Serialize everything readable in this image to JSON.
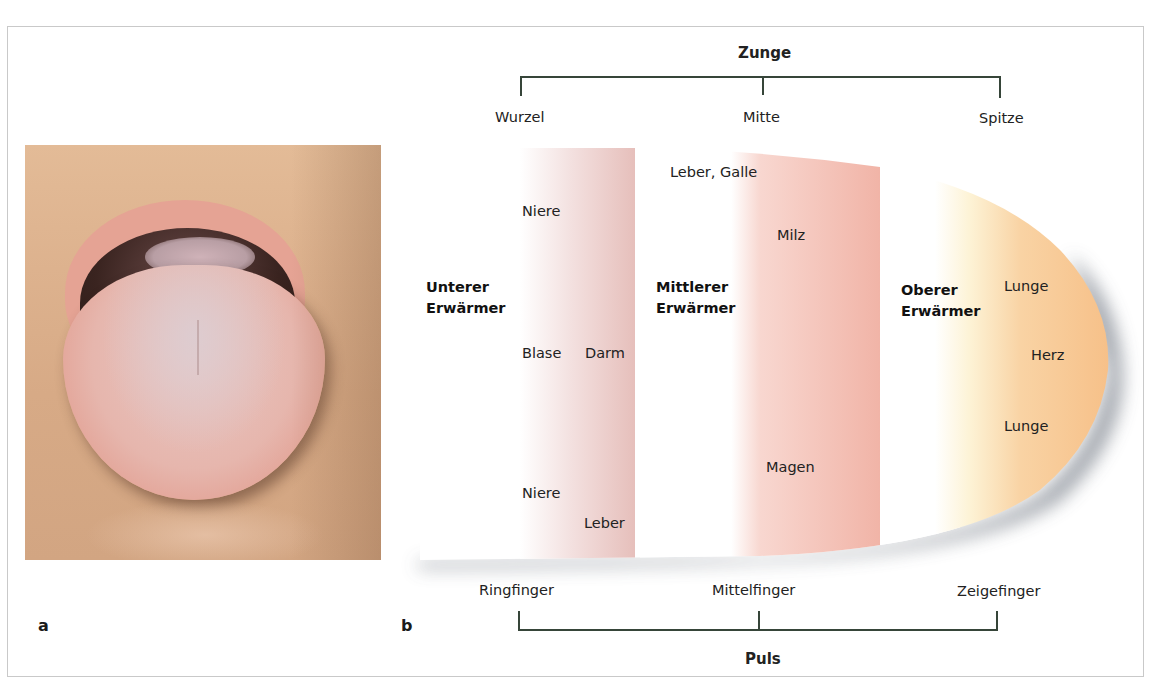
{
  "figure": {
    "panel_a_label": "a",
    "panel_b_label": "b",
    "photo_description": "tongue-photo"
  },
  "tongue": {
    "title": "Zunge",
    "parts": [
      "Wurzel",
      "Mitte",
      "Spitze"
    ]
  },
  "pulse": {
    "title": "Puls",
    "fingers": [
      "Ringfinger",
      "Mittelfinger",
      "Zeigefinger"
    ]
  },
  "zones": {
    "lower": {
      "title_line1": "Unterer",
      "title_line2": "Erwärmer",
      "organs": [
        "Niere",
        "Blase",
        "Darm",
        "Niere",
        "Leber"
      ],
      "color": "#e9c6c3"
    },
    "middle": {
      "title_line1": "Mittlerer",
      "title_line2": "Erwärmer",
      "organs": [
        "Leber, Galle",
        "Milz",
        "Magen"
      ],
      "color": "#f2b9ad"
    },
    "upper": {
      "title_line1": "Oberer",
      "title_line2": "Erwärmer",
      "organs": [
        "Lunge",
        "Herz",
        "Lunge"
      ],
      "color": "#f7c48e"
    }
  },
  "colors": {
    "bracket": "#364539",
    "frame": "#c9c9c9",
    "shadow": "#8e939c"
  }
}
